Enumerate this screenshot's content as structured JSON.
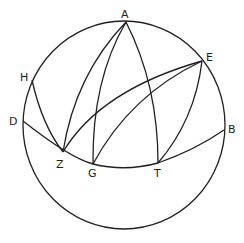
{
  "figure": {
    "type": "spherical-geometry-diagram",
    "stroke_color": "#231f20",
    "background": "#ffffff",
    "circle": {
      "cx": 124,
      "cy": 125,
      "rx": 101,
      "ry": 104
    },
    "points": [
      {
        "label": "A",
        "x": 126,
        "y": 22,
        "lx": 121,
        "ly": 18
      },
      {
        "label": "E",
        "x": 202,
        "y": 61,
        "lx": 206,
        "ly": 61
      },
      {
        "label": "H",
        "x": 32,
        "y": 80,
        "lx": 20,
        "ly": 81
      },
      {
        "label": "D",
        "x": 23,
        "y": 121,
        "lx": 9,
        "ly": 125
      },
      {
        "label": "B",
        "x": 224,
        "y": 130,
        "lx": 228,
        "ly": 133
      },
      {
        "label": "Z",
        "x": 63,
        "y": 152,
        "lx": 56,
        "ly": 168
      },
      {
        "label": "G",
        "x": 93,
        "y": 164,
        "lx": 88,
        "ly": 177
      },
      {
        "label": "T",
        "x": 158,
        "y": 163,
        "lx": 154,
        "ly": 177
      }
    ],
    "arcs": [
      {
        "name": "arc-D-Z-G-T-B",
        "d": "M23,121 Q70,158 93,164 Q125,172 158,163 Q195,150 224,130"
      },
      {
        "name": "arc-H-Z",
        "d": "M32,80 Q42,125 63,152"
      },
      {
        "name": "arc-A-Z",
        "d": "M126,22 Q75,75 63,152"
      },
      {
        "name": "arc-A-G",
        "d": "M126,22 Q92,80 93,164"
      },
      {
        "name": "arc-A-T",
        "d": "M126,22 Q158,85 158,163"
      },
      {
        "name": "arc-Z-E",
        "d": "M63,152 Q100,90 202,61"
      },
      {
        "name": "arc-G-E",
        "d": "M93,164 Q130,95 202,61"
      },
      {
        "name": "arc-T-E",
        "d": "M158,163 Q195,120 202,61"
      }
    ]
  }
}
